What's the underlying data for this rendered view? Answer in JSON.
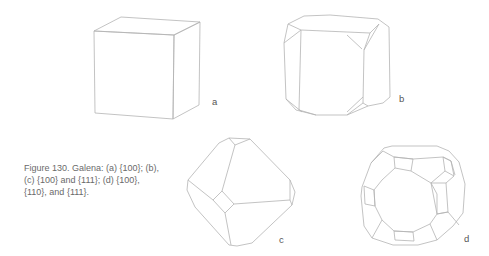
{
  "figure": {
    "caption": "Figure 130. Galena: (a) {100}; (b), (c) {100} and {111}; (d) {100}, {110}, and {111}.",
    "panels": [
      {
        "label": "a",
        "forms": "{100}",
        "shape": "cube"
      },
      {
        "label": "b",
        "forms": "{100} and {111}",
        "shape": "cube modified by octahedron"
      },
      {
        "label": "c",
        "forms": "{100} and {111}",
        "shape": "octahedron modified by cube"
      },
      {
        "label": "d",
        "forms": "{100}, {110}, and {111}",
        "shape": "cube-octahedron-dodecahedron combination"
      }
    ]
  }
}
